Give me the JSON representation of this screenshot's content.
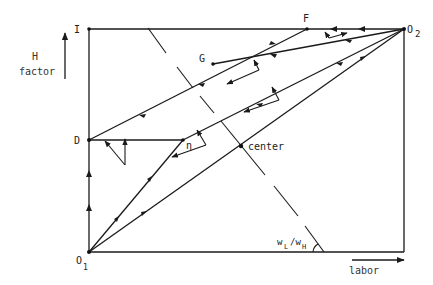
{
  "labels": {
    "I": "I",
    "D": "D",
    "O1": "O",
    "O1_sub": "1",
    "O2": "O",
    "O2_sub": "2",
    "F": "F",
    "G": "G",
    "eta": "η",
    "center": "center",
    "wage_ratio_w": "w",
    "wage_ratio_L": "L",
    "wage_ratio_slash": "/w",
    "wage_ratio_H": "H"
  },
  "axes": {
    "vertical_label_line1": "H",
    "vertical_label_line2": "factor",
    "horizontal_label": "labor"
  },
  "points": {
    "I": [
      89,
      29
    ],
    "O2": [
      404,
      29
    ],
    "O1": [
      89,
      252
    ],
    "corner_br": [
      404,
      252
    ],
    "D": [
      89,
      140
    ],
    "eta": [
      183,
      140
    ],
    "G": [
      213,
      64
    ],
    "F": [
      307,
      29
    ],
    "center": [
      241,
      146
    ]
  },
  "colors": {
    "ink": "#1a1a1a",
    "background": "#ffffff"
  }
}
